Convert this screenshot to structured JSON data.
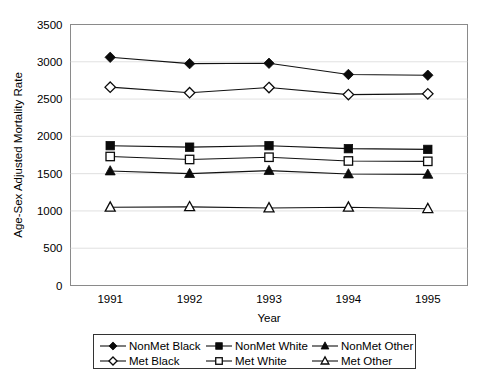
{
  "chart_data": {
    "type": "line",
    "title": "",
    "xlabel": "Year",
    "ylabel": "Age-Sex Adjusted Mortality Rate",
    "categories": [
      "1991",
      "1992",
      "1993",
      "1994",
      "1995"
    ],
    "x": [
      1991,
      1992,
      1993,
      1994,
      1995
    ],
    "ylim": [
      0,
      3500
    ],
    "yticks": [
      0,
      500,
      1000,
      1500,
      2000,
      2500,
      3000,
      3500
    ],
    "ytick_labels": [
      "0",
      "500",
      "1000",
      "1500",
      "2000",
      "2500",
      "3000",
      "3500"
    ],
    "grid": true,
    "grid_axis": "y",
    "legend_position": "bottom",
    "legend_columns": 3,
    "series": [
      {
        "name": "NonMet Black",
        "marker": "filled-diamond",
        "color": "#0a0a0a",
        "values": [
          3060,
          2975,
          2980,
          2830,
          2820
        ]
      },
      {
        "name": "NonMet White",
        "marker": "filled-square",
        "color": "#0a0a0a",
        "values": [
          1875,
          1855,
          1875,
          1835,
          1825
        ]
      },
      {
        "name": "NonMet Other",
        "marker": "filled-triangle",
        "color": "#0a0a0a",
        "values": [
          1535,
          1500,
          1540,
          1495,
          1490
        ]
      },
      {
        "name": "Met Black",
        "marker": "open-diamond",
        "color": "#0a0a0a",
        "values": [
          2660,
          2585,
          2655,
          2560,
          2570
        ]
      },
      {
        "name": "Met White",
        "marker": "open-square",
        "color": "#0a0a0a",
        "values": [
          1730,
          1690,
          1720,
          1670,
          1665
        ]
      },
      {
        "name": "Met Other",
        "marker": "open-triangle",
        "color": "#0a0a0a",
        "values": [
          1050,
          1055,
          1040,
          1050,
          1030
        ]
      }
    ],
    "legend_order": [
      "NonMet Black",
      "NonMet White",
      "NonMet Other",
      "Met Black",
      "Met White",
      "Met Other"
    ]
  }
}
